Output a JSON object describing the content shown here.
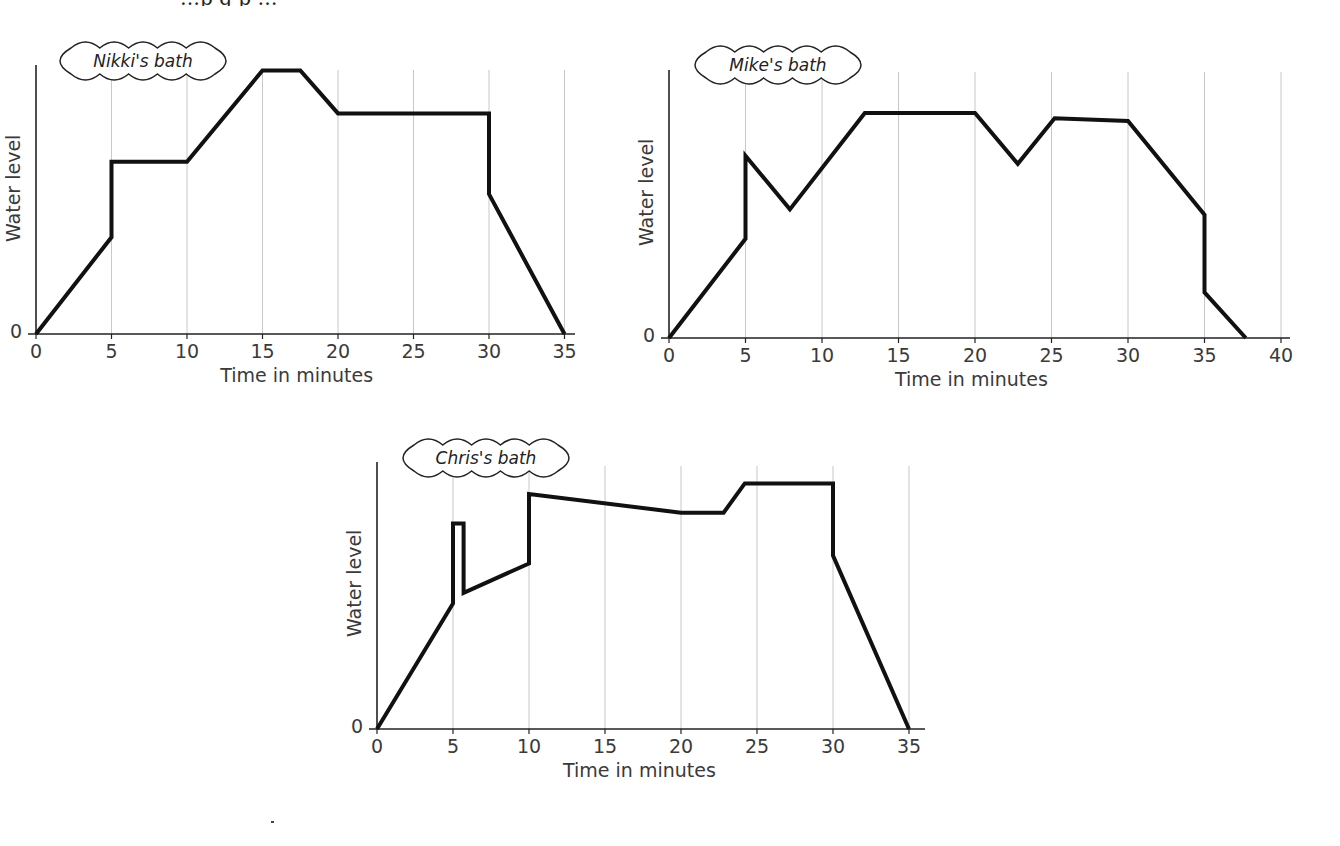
{
  "page": {
    "clipped_top_text": "…p g p …"
  },
  "chart_data": [
    {
      "type": "line",
      "title": "Nikki's bath",
      "xlabel": "Time in minutes",
      "ylabel": "Water level",
      "xlim": [
        0,
        35
      ],
      "ylim": [
        0,
        100
      ],
      "x_ticks": [
        0,
        5,
        10,
        15,
        20,
        25,
        30,
        35
      ],
      "y_ticks": [
        0
      ],
      "grid": "vertical",
      "points": [
        [
          0,
          0
        ],
        [
          5,
          36
        ],
        [
          5,
          64
        ],
        [
          10,
          64
        ],
        [
          15,
          98
        ],
        [
          17.5,
          98
        ],
        [
          20,
          82
        ],
        [
          30,
          82
        ],
        [
          30,
          52
        ],
        [
          35,
          0
        ]
      ]
    },
    {
      "type": "line",
      "title": "Mike's bath",
      "xlabel": "Time in minutes",
      "ylabel": "Water level",
      "xlim": [
        0,
        40
      ],
      "ylim": [
        0,
        100
      ],
      "x_ticks": [
        0,
        5,
        10,
        15,
        20,
        25,
        30,
        35,
        40
      ],
      "y_ticks": [
        0
      ],
      "grid": "vertical",
      "points": [
        [
          0,
          0
        ],
        [
          5,
          37
        ],
        [
          5,
          68
        ],
        [
          7.9,
          48
        ],
        [
          12.8,
          84
        ],
        [
          20,
          84
        ],
        [
          22.8,
          65
        ],
        [
          25.2,
          82
        ],
        [
          30,
          81
        ],
        [
          35,
          46
        ],
        [
          35,
          17
        ],
        [
          37.7,
          0
        ]
      ]
    },
    {
      "type": "line",
      "title": "Chris's bath",
      "xlabel": "Time in minutes",
      "ylabel": "Water level",
      "xlim": [
        0,
        35
      ],
      "ylim": [
        0,
        100
      ],
      "x_ticks": [
        0,
        5,
        10,
        15,
        20,
        25,
        30,
        35
      ],
      "y_ticks": [
        0
      ],
      "grid": "vertical",
      "points": [
        [
          0,
          0
        ],
        [
          5,
          47
        ],
        [
          5,
          77
        ],
        [
          5.7,
          77
        ],
        [
          5.7,
          51
        ],
        [
          10,
          62
        ],
        [
          10,
          88
        ],
        [
          20,
          81
        ],
        [
          22.8,
          81
        ],
        [
          24.2,
          92
        ],
        [
          30,
          92
        ],
        [
          30,
          65
        ],
        [
          35,
          0
        ]
      ]
    }
  ],
  "layout": [
    {
      "name": "nikki",
      "ox": 36,
      "oy": 334,
      "pxPerMin": 15.1,
      "h": 269,
      "axisTop": 65,
      "axisRight": 575,
      "gridTop": 70,
      "title_x": 57,
      "title_y": 44,
      "title_w": 172
    },
    {
      "name": "mike",
      "ox": 669,
      "oy": 338,
      "pxPerMin": 15.3,
      "h": 268,
      "axisTop": 70,
      "axisRight": 1290,
      "gridTop": 72,
      "title_x": 692,
      "title_y": 48,
      "title_w": 172
    },
    {
      "name": "chris",
      "ox": 377,
      "oy": 729,
      "pxPerMin": 15.2,
      "h": 267,
      "axisTop": 462,
      "axisRight": 925,
      "gridTop": 466,
      "title_x": 400,
      "title_y": 441,
      "title_w": 172
    }
  ]
}
